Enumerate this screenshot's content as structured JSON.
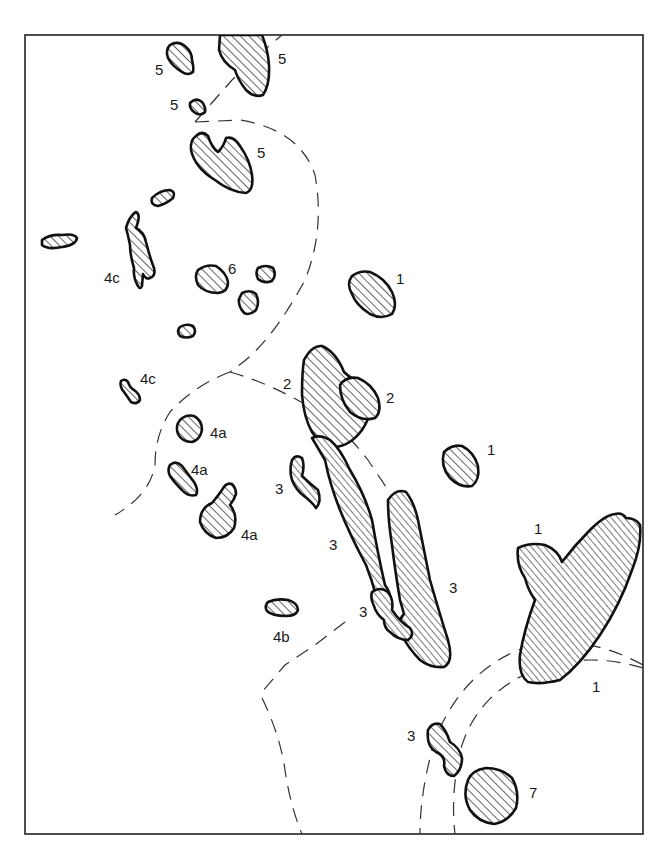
{
  "diagram": {
    "type": "outcrop-map",
    "frame": {
      "x": 25,
      "y": 35,
      "width": 618,
      "height": 799
    },
    "labels": [
      {
        "id": "l5a",
        "text": "5",
        "x": 155,
        "y": 75
      },
      {
        "id": "l5b",
        "text": "5",
        "x": 278,
        "y": 64
      },
      {
        "id": "l5c",
        "text": "5",
        "x": 170,
        "y": 110
      },
      {
        "id": "l5d",
        "text": "5",
        "x": 257,
        "y": 158
      },
      {
        "id": "l6",
        "text": "6",
        "x": 228,
        "y": 274
      },
      {
        "id": "l4c1",
        "text": "4c",
        "x": 104,
        "y": 283
      },
      {
        "id": "l4c2",
        "text": "4c",
        "x": 140,
        "y": 384
      },
      {
        "id": "l1a",
        "text": "1",
        "x": 396,
        "y": 284
      },
      {
        "id": "l2a",
        "text": "2",
        "x": 283,
        "y": 389
      },
      {
        "id": "l2b",
        "text": "2",
        "x": 386,
        "y": 403
      },
      {
        "id": "l1b",
        "text": "1",
        "x": 487,
        "y": 455
      },
      {
        "id": "l4a1",
        "text": "4a",
        "x": 210,
        "y": 438
      },
      {
        "id": "l4a2",
        "text": "4a",
        "x": 191,
        "y": 475
      },
      {
        "id": "l4a3",
        "text": "4a",
        "x": 241,
        "y": 540
      },
      {
        "id": "l3a",
        "text": "3",
        "x": 275,
        "y": 494
      },
      {
        "id": "l3b",
        "text": "3",
        "x": 329,
        "y": 550
      },
      {
        "id": "l1c",
        "text": "1",
        "x": 534,
        "y": 534
      },
      {
        "id": "l3c",
        "text": "3",
        "x": 449,
        "y": 593
      },
      {
        "id": "l3d",
        "text": "3",
        "x": 359,
        "y": 617
      },
      {
        "id": "l4b",
        "text": "4b",
        "x": 273,
        "y": 642
      },
      {
        "id": "l1d",
        "text": "1",
        "x": 592,
        "y": 692
      },
      {
        "id": "l3e",
        "text": "3",
        "x": 407,
        "y": 741
      },
      {
        "id": "l7",
        "text": "7",
        "x": 529,
        "y": 798
      }
    ]
  }
}
